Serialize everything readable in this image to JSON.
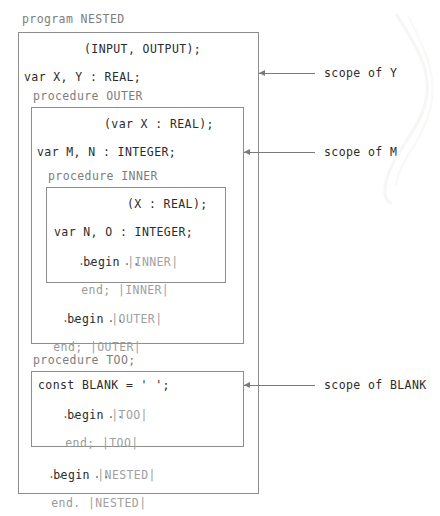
{
  "figure": {
    "caption": ""
  },
  "colors": {
    "text": "#2b2b2b",
    "dim_text": "#9a9a9a",
    "mid_text": "#7d7d7d",
    "brace": "#a0a0a0",
    "box_border": "#8d8d8d",
    "arrow": "#7a7a7a",
    "background": "#ffffff"
  },
  "code": {
    "program_header": "program NESTED",
    "nested": {
      "params": "(INPUT, OUTPUT);",
      "var_decl": "var X, Y : REAL;",
      "begin": "begin ",
      "begin_tag": "|NESTED|",
      "dots": ".......",
      "end": "end. ",
      "end_tag": "|NESTED|"
    },
    "outer": {
      "header": "procedure OUTER",
      "params": "(var X : REAL);",
      "var_decl": "var M, N : INTEGER;",
      "begin": "begin ",
      "begin_tag": "|OUTER|",
      "dots": ".......",
      "end": "end; ",
      "end_tag": "|OUTER|"
    },
    "inner": {
      "header": "procedure INNER",
      "params": "(X : REAL);",
      "var_decl": "var N, O : INTEGER;",
      "begin": "begin ",
      "begin_tag": "|INNER|",
      "dots": ".......",
      "end": "end; ",
      "end_tag": "|INNER|"
    },
    "too": {
      "header": "procedure TOO;",
      "const_decl": "const BLANK = ' ';",
      "begin": "begin ",
      "begin_tag": "|TOO|",
      "dots": ".......",
      "end": "end; ",
      "end_tag": "|TOO|"
    }
  },
  "annotations": [
    {
      "id": "scope-of-y",
      "label": "scope of Y",
      "target": "box-nested"
    },
    {
      "id": "scope-of-m",
      "label": "scope of M",
      "target": "box-outer"
    },
    {
      "id": "scope-of-blank",
      "label": "scope of BLANK",
      "target": "box-too"
    }
  ]
}
